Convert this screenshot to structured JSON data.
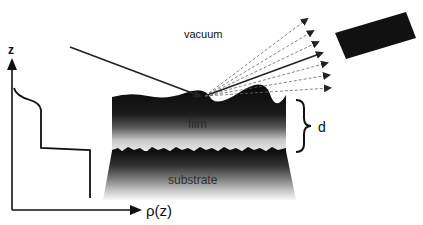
{
  "labels": {
    "vacuum": "vacuum",
    "film": "film",
    "substrate": "substrate",
    "thickness": "d",
    "z_axis": "z",
    "rho_axis": "ρ(z)"
  },
  "colors": {
    "ink": "#111111",
    "film_dark": "#0d0d0d",
    "interface_light": "#d8d8d8",
    "substrate_fade": "#f4f4f4",
    "ray_dashed": "#555555"
  },
  "elements": {
    "incident_beam": "incident-ray",
    "reflected_beams": 7,
    "detector": "detector"
  }
}
